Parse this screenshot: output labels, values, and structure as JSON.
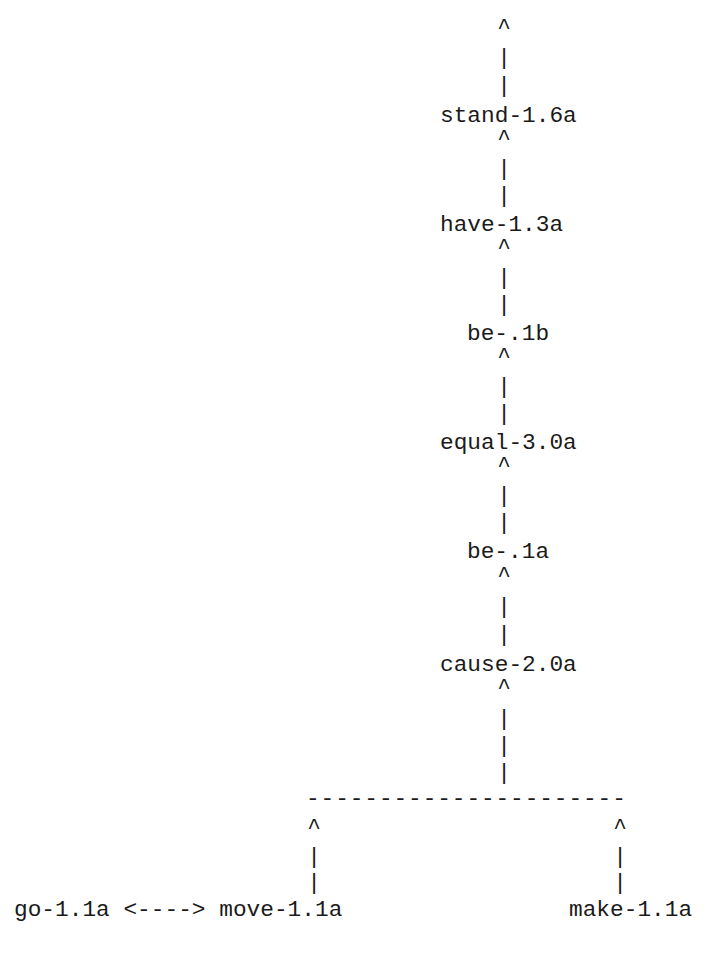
{
  "diagram": {
    "type": "verb-hierarchy",
    "spine_nodes": [
      {
        "label": "stand-1.6a"
      },
      {
        "label": "have-1.3a"
      },
      {
        "label": "be-.1b"
      },
      {
        "label": "equal-3.0a"
      },
      {
        "label": "be-.1a"
      },
      {
        "label": "cause-2.0a"
      }
    ],
    "branch_line": "----------------------",
    "leaves": {
      "left_pair": "go-1.1a <----> move-1.1a",
      "right": "make-1.1a"
    },
    "glyphs": {
      "arrow_up": "^",
      "bar": "|"
    }
  }
}
